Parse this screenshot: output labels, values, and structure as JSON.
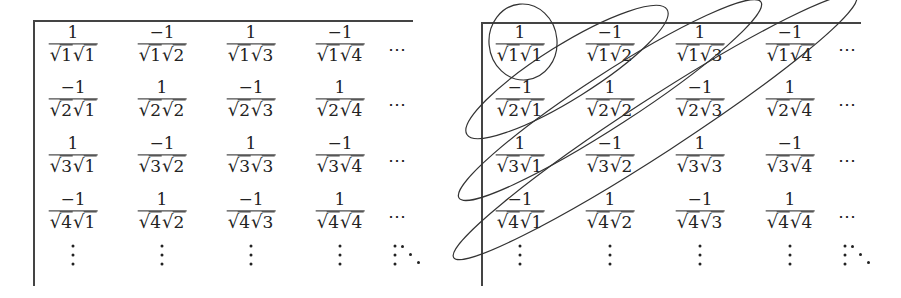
{
  "figure": {
    "matrix": {
      "rows": [
        [
          {
            "num": "1",
            "den_a": "1",
            "den_b": "1"
          },
          {
            "num": "−1",
            "den_a": "1",
            "den_b": "2"
          },
          {
            "num": "1",
            "den_a": "1",
            "den_b": "3"
          },
          {
            "num": "−1",
            "den_a": "1",
            "den_b": "4"
          }
        ],
        [
          {
            "num": "−1",
            "den_a": "2",
            "den_b": "1"
          },
          {
            "num": "1",
            "den_a": "2",
            "den_b": "2"
          },
          {
            "num": "−1",
            "den_a": "2",
            "den_b": "3"
          },
          {
            "num": "1",
            "den_a": "2",
            "den_b": "4"
          }
        ],
        [
          {
            "num": "1",
            "den_a": "3",
            "den_b": "1"
          },
          {
            "num": "−1",
            "den_a": "3",
            "den_b": "2"
          },
          {
            "num": "1",
            "den_a": "3",
            "den_b": "3"
          },
          {
            "num": "−1",
            "den_a": "3",
            "den_b": "4"
          }
        ],
        [
          {
            "num": "−1",
            "den_a": "4",
            "den_b": "1"
          },
          {
            "num": "1",
            "den_a": "4",
            "den_b": "2"
          },
          {
            "num": "−1",
            "den_a": "4",
            "den_b": "3"
          },
          {
            "num": "1",
            "den_a": "4",
            "den_b": "4"
          }
        ]
      ],
      "hdots": "⋯",
      "root_symbol": "√"
    },
    "right_panel": {
      "diagonal_groups": 4,
      "annotation": "ellipses enclosing anti-diagonals"
    }
  }
}
